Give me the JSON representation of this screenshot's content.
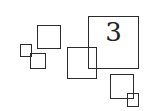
{
  "diagram": {
    "stroke_color": "#2b2b2b",
    "background": "#ffffff",
    "squares": [
      {
        "id": "A",
        "x": 37,
        "y": 25,
        "w": 24,
        "h": 24,
        "label": ""
      },
      {
        "id": "B",
        "x": 20,
        "y": 44,
        "w": 12,
        "h": 13,
        "label": ""
      },
      {
        "id": "C",
        "x": 30,
        "y": 53,
        "w": 16,
        "h": 16,
        "label": ""
      },
      {
        "id": "D",
        "x": 67,
        "y": 47,
        "w": 30,
        "h": 32,
        "label": ""
      },
      {
        "id": "big",
        "x": 88,
        "y": 16,
        "w": 51,
        "h": 53,
        "label": "3"
      },
      {
        "id": "E",
        "x": 110,
        "y": 74,
        "w": 24,
        "h": 25,
        "label": ""
      },
      {
        "id": "F",
        "x": 127,
        "y": 93,
        "w": 12,
        "h": 14,
        "label": ""
      }
    ]
  }
}
